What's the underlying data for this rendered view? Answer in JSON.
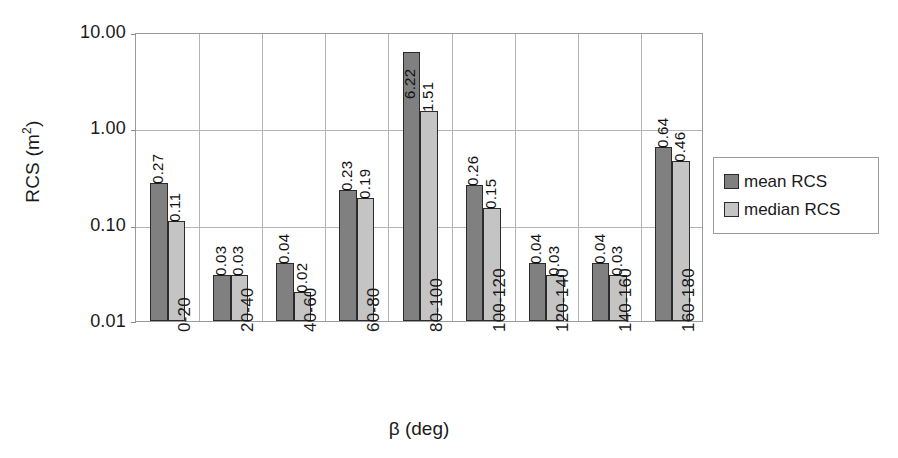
{
  "chart_data": {
    "type": "bar",
    "title": "",
    "xlabel": "β (deg)",
    "ylabel": "RCS (m²)",
    "ylabel_base": "RCS (m",
    "ylabel_sup": "2",
    "ylabel_tail": ")",
    "yscale": "log",
    "ylim": [
      0.01,
      10.0
    ],
    "ytick_labels": [
      "10.00",
      "1.00",
      "0.10",
      "0.01"
    ],
    "ytick_values": [
      10.0,
      1.0,
      0.1,
      0.01
    ],
    "grid": true,
    "legend_position": "right",
    "categories": [
      "0-20",
      "20-40",
      "40-60",
      "60-80",
      "80-100",
      "100-120",
      "120-140",
      "140-160",
      "160-180"
    ],
    "series": [
      {
        "name": "mean RCS",
        "color": "#808080",
        "values": [
          0.27,
          0.03,
          0.04,
          0.23,
          6.22,
          0.26,
          0.04,
          0.04,
          0.64
        ],
        "labels": [
          "0.27",
          "0.03",
          "0.04",
          "0.23",
          "6.22",
          "0.26",
          "0.04",
          "0.04",
          "0.64"
        ]
      },
      {
        "name": "median RCS",
        "color": "#c4c4c4",
        "values": [
          0.11,
          0.03,
          0.02,
          0.19,
          1.51,
          0.15,
          0.03,
          0.03,
          0.46
        ],
        "labels": [
          "0.11",
          "0.03",
          "0.02",
          "0.19",
          "1.51",
          "0.15",
          "0.03",
          "0.03",
          "0.46"
        ]
      }
    ]
  },
  "legend": {
    "entries": [
      {
        "label": "mean RCS",
        "swatch": "mean"
      },
      {
        "label": "median RCS",
        "swatch": "median"
      }
    ]
  },
  "colors": {
    "mean_bar": "#808080",
    "median_bar": "#c4c4c4",
    "bar_outline": "#2b2b2b",
    "gridline": "#b4b4b4",
    "axis": "#9b9b9b",
    "background": "#ffffff",
    "text": "#1a1a1a"
  }
}
